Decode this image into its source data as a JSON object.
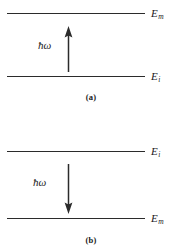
{
  "figure": {
    "line_color": "#2b2b2b",
    "background_color": "#ffffff"
  },
  "panels": [
    {
      "id": "a",
      "caption": "(a)",
      "process": "absorption",
      "arrow_direction": "up",
      "photon_label": "ħω",
      "levels": [
        {
          "position": "upper",
          "label_base": "E",
          "label_sub": "m",
          "label_full": "Eₘ"
        },
        {
          "position": "lower",
          "label_base": "E",
          "label_sub": "i",
          "label_full": "Eᵢ"
        }
      ]
    },
    {
      "id": "b",
      "caption": "(b)",
      "process": "emission",
      "arrow_direction": "down",
      "photon_label": "ħω",
      "levels": [
        {
          "position": "upper",
          "label_base": "E",
          "label_sub": "i",
          "label_full": "Eᵢ"
        },
        {
          "position": "lower",
          "label_base": "E",
          "label_sub": "m",
          "label_full": "Eₘ"
        }
      ]
    }
  ]
}
